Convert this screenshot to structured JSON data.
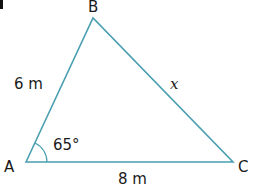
{
  "diagram": {
    "type": "triangle",
    "line_color": "#4a9fb0",
    "vertices": {
      "A": {
        "label": "A"
      },
      "B": {
        "label": "B"
      },
      "C": {
        "label": "C"
      }
    },
    "sides": {
      "AB": {
        "label": "6 m"
      },
      "AC": {
        "label": "8 m"
      },
      "BC": {
        "label": "x"
      }
    },
    "angles": {
      "A": {
        "label": "65°"
      }
    }
  }
}
